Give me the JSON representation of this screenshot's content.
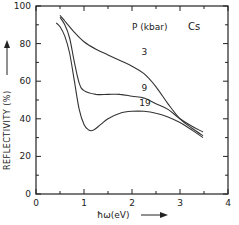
{
  "chart_data": {
    "type": "line",
    "title": "",
    "element_label": "Cs",
    "legend_title": "P (kbar)",
    "xlabel": "ħω(eV)",
    "ylabel": "REFLECTIVITY (%)",
    "xlim": [
      0,
      4
    ],
    "ylim": [
      0,
      100
    ],
    "xticks": [
      "0",
      "1",
      "2",
      "3",
      "4"
    ],
    "yticks": [
      "0",
      "20",
      "40",
      "60",
      "80",
      "100"
    ],
    "grid": false,
    "series": [
      {
        "name": "3",
        "x": [
          0.5,
          0.6,
          0.8,
          1.0,
          1.25,
          1.5,
          1.75,
          2.0,
          2.25,
          2.5,
          2.75,
          3.0,
          3.25,
          3.48
        ],
        "y": [
          95,
          92,
          86,
          81,
          77,
          74,
          71,
          68,
          64,
          57,
          48,
          40,
          35,
          31
        ]
      },
      {
        "name": "9",
        "x": [
          0.5,
          0.6,
          0.7,
          0.8,
          0.9,
          1.0,
          1.25,
          1.5,
          1.75,
          2.0,
          2.25,
          2.5,
          2.75,
          3.0,
          3.25,
          3.48
        ],
        "y": [
          94,
          90,
          83,
          70,
          59,
          55,
          53,
          53,
          53,
          52,
          51,
          48,
          45,
          40,
          36,
          33
        ]
      },
      {
        "name": "19",
        "x": [
          0.42,
          0.5,
          0.6,
          0.7,
          0.8,
          0.9,
          1.0,
          1.1,
          1.2,
          1.35,
          1.5,
          1.75,
          2.0,
          2.25,
          2.5,
          2.75,
          3.0,
          3.25,
          3.48
        ],
        "y": [
          91,
          89,
          84,
          75,
          60,
          45,
          37,
          34,
          34,
          37,
          40,
          43,
          44,
          44,
          43,
          41,
          38,
          34,
          30
        ]
      }
    ],
    "annotations": [
      {
        "text": "3",
        "x": 2.2,
        "y": 74
      },
      {
        "text": "9",
        "x": 2.2,
        "y": 55
      },
      {
        "text": "19",
        "x": 2.15,
        "y": 47
      }
    ]
  }
}
